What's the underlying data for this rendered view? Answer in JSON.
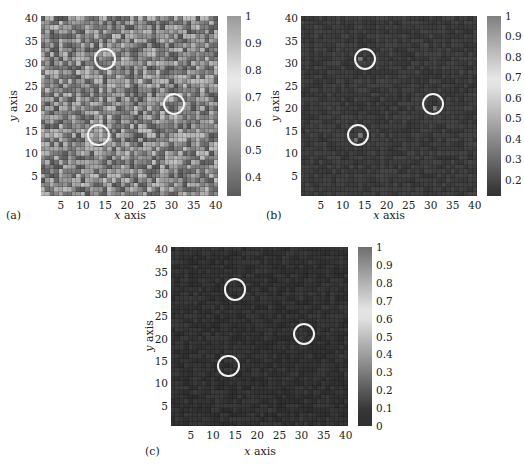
{
  "figure": {
    "panels": [
      {
        "id": "a",
        "label": "(a)",
        "xlabel_var": "x",
        "xlabel_rest": " axis",
        "ylabel_var": "y",
        "ylabel_rest": " axis",
        "xticks": [
          "5",
          "10",
          "15",
          "20",
          "25",
          "30",
          "35",
          "40"
        ],
        "yticks": [
          "5",
          "10",
          "15",
          "20",
          "25",
          "30",
          "35",
          "40"
        ],
        "colorbar_ticks": [
          "1",
          "0.9",
          "0.8",
          "0.7",
          "0.6",
          "0.5",
          "0.4"
        ],
        "colorbar_range": [
          0.33,
          1.0
        ]
      },
      {
        "id": "b",
        "label": "(b)",
        "xlabel_var": "x",
        "xlabel_rest": " axis",
        "ylabel_var": "y",
        "ylabel_rest": " axis",
        "xticks": [
          "5",
          "10",
          "15",
          "20",
          "25",
          "30",
          "35",
          "40"
        ],
        "yticks": [
          "5",
          "10",
          "15",
          "20",
          "25",
          "30",
          "35",
          "40"
        ],
        "colorbar_ticks": [
          "1",
          "0.9",
          "0.8",
          "0.7",
          "0.6",
          "0.5",
          "0.4",
          "0.3",
          "0.2"
        ],
        "colorbar_range": [
          0.12,
          1.0
        ]
      },
      {
        "id": "c",
        "label": "(c)",
        "xlabel_var": "x",
        "xlabel_rest": " axis",
        "ylabel_var": "y",
        "ylabel_rest": " axis",
        "xticks": [
          "5",
          "10",
          "15",
          "20",
          "25",
          "30",
          "35",
          "40"
        ],
        "yticks": [
          "5",
          "10",
          "15",
          "20",
          "25",
          "30",
          "35",
          "40"
        ],
        "colorbar_ticks": [
          "1",
          "0.9",
          "0.8",
          "0.7",
          "0.6",
          "0.5",
          "0.4",
          "0.3",
          "0.2",
          "0.1",
          "0"
        ],
        "colorbar_range": [
          0.0,
          1.0
        ]
      }
    ]
  },
  "chart_data": [
    {
      "type": "heatmap",
      "title": "(a)",
      "xlabel": "x axis",
      "ylabel": "y axis",
      "xlim": [
        0.5,
        40.5
      ],
      "ylim": [
        0.5,
        40.5
      ],
      "grid_size": [
        40,
        40
      ],
      "colorbar": {
        "min": 0.33,
        "max": 1.0,
        "ticks": [
          0.4,
          0.5,
          0.6,
          0.7,
          0.8,
          0.9,
          1.0
        ]
      },
      "description": "Noisy mid-range field (~0.4–0.9) with patchy dark and light cells across the whole grid",
      "annotations": [
        {
          "shape": "circle",
          "center": [
            15,
            31
          ],
          "radius": 2.5
        },
        {
          "shape": "circle",
          "center": [
            30.5,
            21
          ],
          "radius": 2.5
        },
        {
          "shape": "circle",
          "center": [
            13.5,
            14
          ],
          "radius": 2.5
        }
      ]
    },
    {
      "type": "heatmap",
      "title": "(b)",
      "xlabel": "x axis",
      "ylabel": "y axis",
      "xlim": [
        0.5,
        40.5
      ],
      "ylim": [
        0.5,
        40.5
      ],
      "grid_size": [
        40,
        40
      ],
      "colorbar": {
        "min": 0.12,
        "max": 1.0,
        "ticks": [
          0.2,
          0.3,
          0.4,
          0.5,
          0.6,
          0.7,
          0.8,
          0.9,
          1.0
        ]
      },
      "description": "Mostly uniform low values (~0.15) with a few slightly brighter cells inside the circled regions",
      "highlight_cells": [
        {
          "x": 14,
          "y": 31,
          "value": 0.35
        },
        {
          "x": 31,
          "y": 20,
          "value": 0.25
        },
        {
          "x": 13,
          "y": 13,
          "value": 0.25
        },
        {
          "x": 14,
          "y": 14,
          "value": 0.22
        }
      ],
      "annotations": [
        {
          "shape": "circle",
          "center": [
            15,
            31
          ],
          "radius": 2.5
        },
        {
          "shape": "circle",
          "center": [
            30.5,
            21
          ],
          "radius": 2.5
        },
        {
          "shape": "circle",
          "center": [
            13.5,
            14
          ],
          "radius": 2.5
        }
      ]
    },
    {
      "type": "heatmap",
      "title": "(c)",
      "xlabel": "x axis",
      "ylabel": "y axis",
      "xlim": [
        0.5,
        40.5
      ],
      "ylim": [
        0.5,
        40.5
      ],
      "grid_size": [
        40,
        40
      ],
      "colorbar": {
        "min": 0.0,
        "max": 1.0,
        "ticks": [
          0,
          0.1,
          0.2,
          0.3,
          0.4,
          0.5,
          0.6,
          0.7,
          0.8,
          0.9,
          1.0
        ]
      },
      "description": "Nearly uniform near-zero field throughout, circles mark the same three regions",
      "annotations": [
        {
          "shape": "circle",
          "center": [
            15,
            31
          ],
          "radius": 2.5
        },
        {
          "shape": "circle",
          "center": [
            30.5,
            21
          ],
          "radius": 2.5
        },
        {
          "shape": "circle",
          "center": [
            13.5,
            14
          ],
          "radius": 2.5
        }
      ]
    }
  ]
}
